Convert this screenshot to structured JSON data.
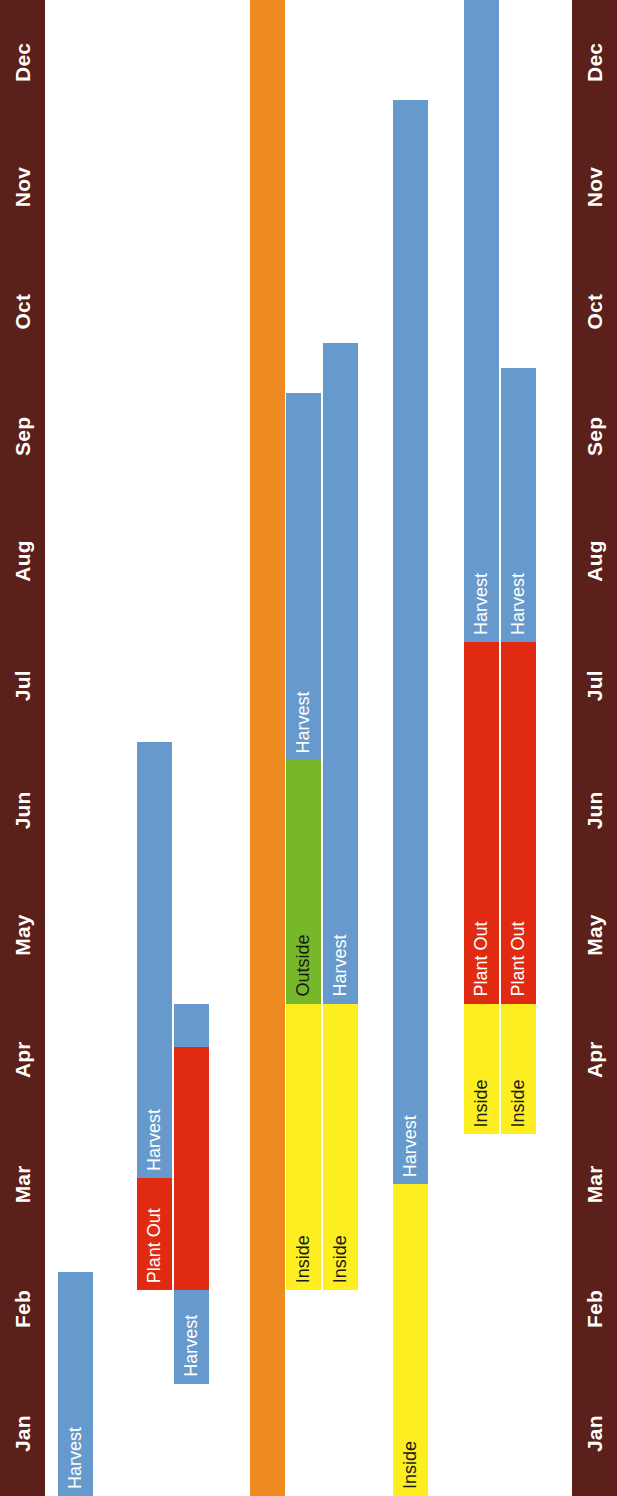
{
  "chart_data": {
    "type": "table",
    "xlabel": "Month",
    "ylabel": "Crop",
    "grid": false,
    "legend": "none",
    "months": [
      "Jan",
      "Feb",
      "Mar",
      "Apr",
      "May",
      "Jun",
      "Jul",
      "Aug",
      "Sep",
      "Oct",
      "Nov",
      "Dec"
    ],
    "xlim": [
      1,
      13
    ],
    "colors": {
      "axis_bar": "#5b2019",
      "harvest": "#6699cc",
      "plant_out": "#e02b12",
      "inside": "#fcee21",
      "outside": "#76b82a",
      "group_header": "#ed8b22",
      "text_light": "#ffffff",
      "text_dark": "#1a1a1a"
    },
    "rows": [
      {
        "crop": "Asparagus",
        "group_header": false,
        "bars": [
          {
            "label": "Harvest",
            "type": "harvest",
            "start": 1.0,
            "end": 2.8,
            "color": "#6699cc",
            "text": "light"
          }
        ]
      },
      {
        "crop": "Perpetual spinach",
        "group_header": false,
        "bars": [
          {
            "label": "Plant Out",
            "type": "plant_out",
            "start": 2.65,
            "end": 4.95,
            "color": "#e02b12",
            "text": "light"
          },
          {
            "label": "Harvest",
            "type": "harvest",
            "start": 3.55,
            "end": 7.05,
            "color": "#6699cc",
            "text": "light"
          }
        ]
      },
      {
        "crop": "Sea kale",
        "group_header": false,
        "bars": [
          {
            "label": "Harvest",
            "type": "harvest",
            "start": 1.9,
            "end": 4.95,
            "color": "#6699cc",
            "text": "light"
          },
          {
            "label": "",
            "type": "plant_out",
            "start": 2.65,
            "end": 4.6,
            "color": "#e02b12",
            "text": "light"
          }
        ]
      },
      {
        "crop": "Summer crops",
        "group_header": true,
        "bars": []
      },
      {
        "crop": "Sweetcorn",
        "group_header": false,
        "bars": [
          {
            "label": "Inside",
            "type": "inside",
            "start": 2.65,
            "end": 4.95,
            "color": "#fcee21",
            "text": "dark"
          },
          {
            "label": "Outside",
            "type": "outside",
            "start": 4.95,
            "end": 6.9,
            "color": "#76b82a",
            "text": "dark"
          },
          {
            "label": "Harvest",
            "type": "harvest",
            "start": 6.9,
            "end": 9.85,
            "color": "#6699cc",
            "text": "light"
          }
        ]
      },
      {
        "crop": "Summer salads & greens",
        "group_header": false,
        "bars": [
          {
            "label": "Inside",
            "type": "inside",
            "start": 2.65,
            "end": 4.95,
            "color": "#fcee21",
            "text": "dark"
          },
          {
            "label": "Outside",
            "type": "outside",
            "start": 4.95,
            "end": 8.05,
            "color": "#76b82a",
            "text": "dark"
          },
          {
            "label": "Harvest",
            "type": "harvest",
            "start": 4.95,
            "end": 10.25,
            "color": "#6699cc",
            "text": "light"
          }
        ]
      },
      {
        "crop": "Hardy salads, oriental greens",
        "group_header": false,
        "bars": [
          {
            "label": "Inside",
            "type": "inside",
            "start": 1.0,
            "end": 3.5,
            "color": "#fcee21",
            "text": "dark"
          },
          {
            "label": "Outside",
            "type": "outside",
            "start": 3.5,
            "end": 10.3,
            "color": "#76b82a",
            "text": "dark"
          },
          {
            "label": "Harvest",
            "type": "harvest",
            "start": 3.5,
            "end": 12.2,
            "color": "#6699cc",
            "text": "light"
          }
        ]
      },
      {
        "crop": "Marrow & courgette",
        "group_header": false,
        "bars": [
          {
            "label": "Inside",
            "type": "inside",
            "start": 3.9,
            "end": 4.95,
            "color": "#fcee21",
            "text": "dark"
          },
          {
            "label": "Plant Out",
            "type": "plant_out",
            "start": 4.95,
            "end": 7.85,
            "color": "#e02b12",
            "text": "light"
          },
          {
            "label": "Harvest",
            "type": "harvest",
            "start": 7.85,
            "end": 13.0,
            "color": "#6699cc",
            "text": "light"
          }
        ]
      },
      {
        "crop": "Pumpkin & squash",
        "group_header": false,
        "bars": [
          {
            "label": "Inside",
            "type": "inside",
            "start": 3.9,
            "end": 4.95,
            "color": "#fcee21",
            "text": "dark"
          },
          {
            "label": "Plant Out",
            "type": "plant_out",
            "start": 4.95,
            "end": 7.85,
            "color": "#e02b12",
            "text": "light"
          },
          {
            "label": "Harvest",
            "type": "harvest",
            "start": 7.85,
            "end": 10.05,
            "color": "#6699cc",
            "text": "light"
          }
        ]
      }
    ]
  }
}
